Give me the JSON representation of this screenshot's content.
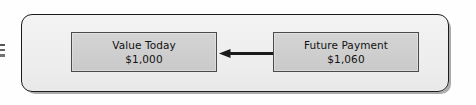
{
  "diagram": {
    "type": "present-value-discounting",
    "nodes": [
      {
        "id": "value-today",
        "title": "Value Today",
        "amount": "$1,000"
      },
      {
        "id": "future-payment",
        "title": "Future Payment",
        "amount": "$1,060"
      }
    ],
    "connector": {
      "id": "discount-arrow",
      "icon": "arrow-left-icon",
      "from": "future-payment",
      "to": "value-today",
      "direction": "left"
    },
    "colors": {
      "frame_border": "#1c1c1c",
      "frame_fill": "#f0f0f0",
      "node_border": "#4a4a4a",
      "node_fill": "#cfcfcf",
      "text": "#111111",
      "arrow": "#1a1a1a",
      "page_background": "#ffffff"
    }
  }
}
